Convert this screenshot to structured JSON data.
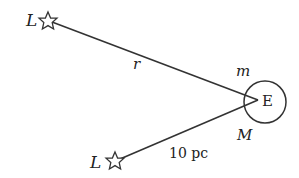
{
  "diagram": {
    "top_star": {
      "label": "L"
    },
    "bottom_star": {
      "label": "L"
    },
    "earth": {
      "label": "E"
    },
    "distance_top": {
      "label": "r"
    },
    "distance_bottom": {
      "label": "10 pc"
    },
    "apparent_magnitude": {
      "label": "m"
    },
    "absolute_magnitude": {
      "label": "M"
    }
  },
  "colors": {
    "stroke": "#333333",
    "background": "#ffffff"
  }
}
